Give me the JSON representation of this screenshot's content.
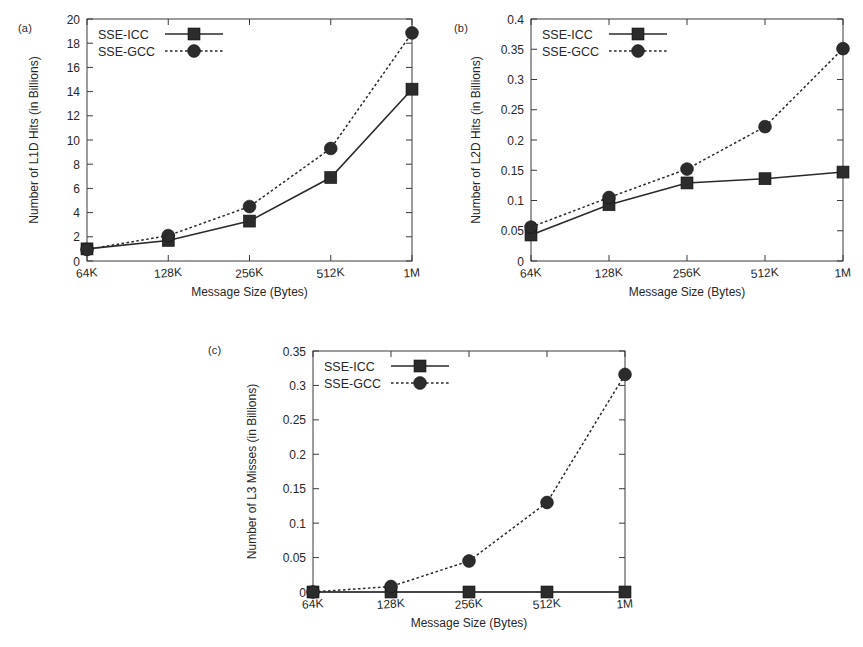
{
  "figure": {
    "background": "#ffffff",
    "ink_color": "#2a2a2a"
  },
  "panels": {
    "a": {
      "label": "(a)"
    },
    "b": {
      "label": "(b)"
    },
    "c": {
      "label": "(c)"
    }
  },
  "legend_labels": {
    "icc": "SSE-ICC",
    "gcc": "SSE-GCC"
  },
  "chart_data": [
    {
      "id": "a",
      "type": "line",
      "title": "",
      "panel_label": "(a)",
      "xlabel": "Message Size (Bytes)",
      "ylabel": "Number of L1D Hits  (in Billions)",
      "categories": [
        "64K",
        "128K",
        "256K",
        "512K",
        "1M"
      ],
      "xtick_labels": [
        "64K",
        "128K",
        "256K",
        "512K",
        "1M"
      ],
      "ytick_labels": [
        "0",
        "2",
        "4",
        "6",
        "8",
        "10",
        "12",
        "14",
        "16",
        "18",
        "20"
      ],
      "yticks": [
        0,
        2,
        4,
        6,
        8,
        10,
        12,
        14,
        16,
        18,
        20
      ],
      "ylim": [
        0,
        20
      ],
      "grid": false,
      "legend_position": "top-left",
      "series": [
        {
          "name": "SSE-ICC",
          "marker": "square",
          "linestyle": "solid",
          "values": [
            1.0,
            1.7,
            3.3,
            6.9,
            14.2
          ]
        },
        {
          "name": "SSE-GCC",
          "marker": "circle",
          "linestyle": "dotted",
          "values": [
            0.95,
            2.1,
            4.5,
            9.3,
            18.85
          ]
        }
      ]
    },
    {
      "id": "b",
      "type": "line",
      "title": "",
      "panel_label": "(b)",
      "xlabel": "Message Size (Bytes)",
      "ylabel": "Number of L2D Hits  (in Billions)",
      "categories": [
        "64K",
        "128K",
        "256K",
        "512K",
        "1M"
      ],
      "xtick_labels": [
        "64K",
        "128K",
        "256K",
        "512K",
        "1M"
      ],
      "ytick_labels": [
        "0",
        "0.05",
        "0.1",
        "0.15",
        "0.2",
        "0.25",
        "0.3",
        "0.35",
        "0.4"
      ],
      "yticks": [
        0,
        0.05,
        0.1,
        0.15,
        0.2,
        0.25,
        0.3,
        0.35,
        0.4
      ],
      "ylim": [
        0,
        0.4
      ],
      "grid": false,
      "legend_position": "top-left",
      "series": [
        {
          "name": "SSE-ICC",
          "marker": "square",
          "linestyle": "solid",
          "values": [
            0.043,
            0.093,
            0.129,
            0.136,
            0.147
          ]
        },
        {
          "name": "SSE-GCC",
          "marker": "circle",
          "linestyle": "dotted",
          "values": [
            0.056,
            0.105,
            0.152,
            0.222,
            0.351
          ]
        }
      ]
    },
    {
      "id": "c",
      "type": "line",
      "title": "",
      "panel_label": "(c)",
      "xlabel": "Message Size (Bytes)",
      "ylabel": "Number of L3 Misses  (in Billions)",
      "categories": [
        "64K",
        "128K",
        "256K",
        "512K",
        "1M"
      ],
      "xtick_labels": [
        "64K",
        "128K",
        "256K",
        "512K",
        "1M"
      ],
      "ytick_labels": [
        "0",
        "0.05",
        "0.1",
        "0.15",
        "0.2",
        "0.25",
        "0.3",
        "0.35"
      ],
      "yticks": [
        0,
        0.05,
        0.1,
        0.15,
        0.2,
        0.25,
        0.3,
        0.35
      ],
      "ylim": [
        0,
        0.35
      ],
      "grid": false,
      "legend_position": "top-left",
      "series": [
        {
          "name": "SSE-ICC",
          "marker": "square",
          "linestyle": "solid",
          "values": [
            0.0,
            0.0,
            0.0,
            0.0,
            0.0
          ]
        },
        {
          "name": "SSE-GCC",
          "marker": "circle",
          "linestyle": "dotted",
          "values": [
            0.0,
            0.008,
            0.045,
            0.13,
            0.316
          ]
        }
      ]
    }
  ]
}
